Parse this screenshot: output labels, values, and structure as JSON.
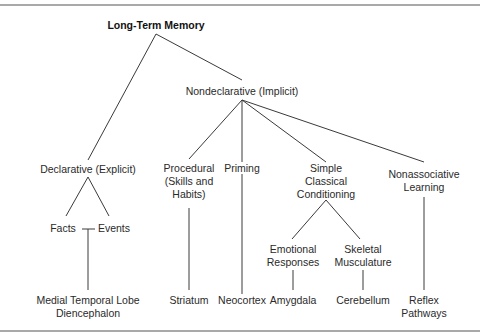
{
  "diagram": {
    "title": "Long-Term Memory",
    "nodes": {
      "nondeclarative": "Nondeclarative (Implicit)",
      "declarative": "Declarative (Explicit)",
      "facts": "Facts",
      "events": "Events",
      "mtl": [
        "Medial Temporal Lobe",
        "Diencephalon"
      ],
      "procedural": [
        "Procedural",
        "(Skills and",
        "Habits)"
      ],
      "priming": "Priming",
      "classical": [
        "Simple",
        "Classical",
        "Conditioning"
      ],
      "nonassociative": [
        "Nonassociative",
        "Learning"
      ],
      "emotional": [
        "Emotional",
        "Responses"
      ],
      "skeletal": [
        "Skeletal",
        "Musculature"
      ],
      "striatum": "Striatum",
      "neocortex": "Neocortex",
      "amygdala": "Amygdala",
      "cerebellum": "Cerebellum",
      "reflex": [
        "Reflex",
        "Pathways"
      ]
    }
  }
}
